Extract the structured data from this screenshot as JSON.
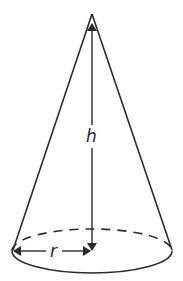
{
  "diagram": {
    "labels": {
      "height": "h",
      "radius": "r"
    },
    "colors": {
      "stroke": "#2a2a2a",
      "background": "#ffffff"
    },
    "shape": {
      "type": "right-circular-cone",
      "apex": [
        92,
        14
      ],
      "base_center": [
        92,
        251
      ],
      "base_rx": 80,
      "base_ry": 22
    },
    "dimensions": [
      {
        "name": "height",
        "label": "h",
        "from": [
          92,
          250
        ],
        "to": [
          92,
          28
        ]
      },
      {
        "name": "radius",
        "label": "r",
        "from": [
          13,
          251
        ],
        "to": [
          91,
          251
        ]
      }
    ]
  }
}
